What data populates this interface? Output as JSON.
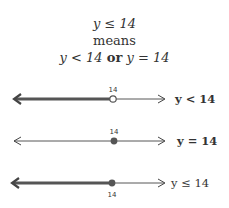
{
  "header": {
    "line1": "y ≤ 14",
    "line2": "means",
    "line3_a": "y < 14",
    "line3_or": "or",
    "line3_b": "y = 14"
  },
  "number_lines": [
    {
      "tick_label": "14",
      "point": "open",
      "shaded": "left",
      "label": "y < 14"
    },
    {
      "tick_label": "14",
      "point": "closed",
      "shaded": "none",
      "label": "y = 14"
    },
    {
      "tick_label": "14",
      "point": "closed",
      "shaded": "left",
      "label": "y ≤ 14"
    }
  ],
  "colors": {
    "text": "#333333",
    "shade": "#555555",
    "line": "#444444"
  }
}
